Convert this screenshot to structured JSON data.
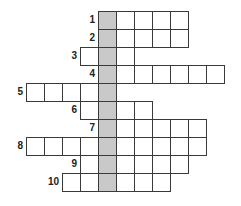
{
  "puzzle": {
    "type": "crossword",
    "cell_size": 18,
    "origin_x": 26,
    "origin_y": 11,
    "shaded_column": 4,
    "colors": {
      "border": "#3a3a3a",
      "shaded": "#c9c9c9",
      "cell": "#ffffff",
      "number": "#222222"
    },
    "rows": [
      {
        "number": "1",
        "start_col": 4,
        "length": 5
      },
      {
        "number": "2",
        "start_col": 4,
        "length": 5
      },
      {
        "number": "3",
        "start_col": 3,
        "length": 3
      },
      {
        "number": "4",
        "start_col": 4,
        "length": 7
      },
      {
        "number": "5",
        "start_col": 0,
        "length": 5
      },
      {
        "number": "6",
        "start_col": 3,
        "length": 4
      },
      {
        "number": "7",
        "start_col": 4,
        "length": 6
      },
      {
        "number": "8",
        "start_col": 0,
        "length": 10
      },
      {
        "number": "9",
        "start_col": 3,
        "length": 6
      },
      {
        "number": "10",
        "start_col": 2,
        "length": 6
      }
    ]
  }
}
